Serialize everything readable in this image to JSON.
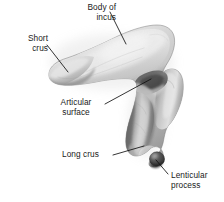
{
  "figure": {
    "name": "incus-anatomical-illustration",
    "subject": "Incus",
    "background_color": "#ffffff",
    "width": 224,
    "height": 202,
    "text_color": "#1a1a1a",
    "leader_line_color": "#111111"
  },
  "labels": {
    "body_of_incus": {
      "line1": "Body of",
      "line2": "incus"
    },
    "short_crus": {
      "line1": "Short",
      "line2": "crus"
    },
    "articular_surface": {
      "line1": "Articular",
      "line2": "surface"
    },
    "long_crus": {
      "line1": "Long crus",
      "line2": ""
    },
    "lenticular_process": {
      "line1": "Lenticular",
      "line2": "process"
    }
  },
  "bone": {
    "body_fill": "#c9c9c9",
    "highlight_fill": "#e4e4e4",
    "midtone_fill": "#b2b2b2",
    "shadow_fill": "#7d7d7d",
    "deep_shadow_fill": "#4a4a4a",
    "lenticular_fill": "#3a3a3a",
    "outline": "#5f5f5f"
  }
}
